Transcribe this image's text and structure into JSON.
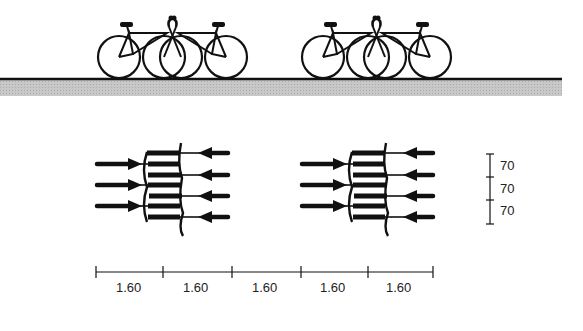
{
  "diagram": {
    "type": "bicycle parking layout",
    "colors": {
      "ink": "#111111",
      "ground": "#bdbdbd",
      "background": "#ffffff"
    },
    "side_view": {
      "description": "Two groups of three interlocked bicycles on the ground",
      "groups": [
        {
          "name": "left-bike-group",
          "bicycles": 3
        },
        {
          "name": "right-bike-group",
          "bicycles": 3
        }
      ]
    },
    "plan_view": {
      "groups": [
        {
          "name": "left-plan-group",
          "arrows_right": 3,
          "arrows_left": 4
        },
        {
          "name": "right-plan-group",
          "arrows_right": 3,
          "arrows_left": 4
        }
      ]
    },
    "vertical_dimensions": {
      "labels": [
        "70",
        "70",
        "70"
      ]
    },
    "horizontal_dimensions": {
      "labels": [
        "1.60",
        "1.60",
        "1.60",
        "1.60",
        "1.60"
      ]
    }
  }
}
